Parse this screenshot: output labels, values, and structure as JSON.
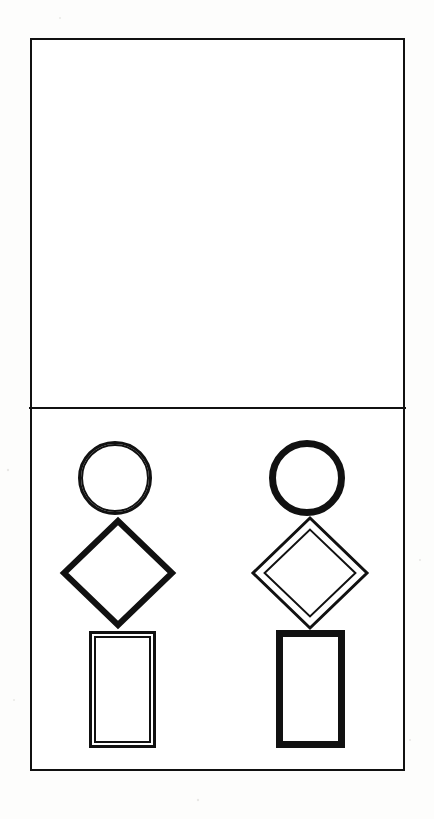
{
  "document": {
    "title": "Two-figure geometric line drawing",
    "background_color": "#fdfdfc",
    "paper_color": "#ffffff",
    "ink_color": "#111111",
    "width": 434,
    "height": 819
  },
  "frame": {
    "name": "outer-rectangle-border",
    "x": 30,
    "y": 38,
    "width": 375,
    "height": 733,
    "stroke_width": 2,
    "stroke_color": "#111111"
  },
  "divider": {
    "name": "horizontal-divider",
    "x1": 30,
    "x2": 405,
    "y": 408,
    "stroke_width": 2,
    "stroke_color": "#111111"
  },
  "panels": [
    {
      "id": "upper-panel",
      "label": "Upper panel",
      "content": "empty",
      "x": 30,
      "y": 38,
      "width": 375,
      "height": 370
    },
    {
      "id": "lower-panel",
      "label": "Lower panel",
      "content": "two figures",
      "x": 30,
      "y": 408,
      "width": 375,
      "height": 363
    }
  ],
  "figures": [
    {
      "id": "left-figure",
      "label": "Left figure",
      "position": "left",
      "parts": [
        {
          "id": "left-head",
          "name": "circle",
          "shape": "circle",
          "line_style": "double",
          "cx": 115,
          "cy": 478,
          "r": 37,
          "inner_r": 33,
          "stroke_width": 3,
          "inner_stroke_width": 2
        },
        {
          "id": "left-body",
          "name": "diamond",
          "shape": "diamond",
          "line_style": "single",
          "cx": 118,
          "cy": 573,
          "rx": 54,
          "ry": 52,
          "stroke_width": 6
        },
        {
          "id": "left-base",
          "name": "rectangle",
          "shape": "rectangle",
          "line_style": "double",
          "x": 89,
          "y": 631,
          "width": 67,
          "height": 117,
          "stroke_width": 3,
          "inset": 6,
          "inner_stroke_width": 2
        }
      ]
    },
    {
      "id": "right-figure",
      "label": "Right figure",
      "position": "right",
      "parts": [
        {
          "id": "right-head",
          "name": "circle",
          "shape": "circle",
          "line_style": "single",
          "cx": 307,
          "cy": 478,
          "r": 38,
          "stroke_width": 7
        },
        {
          "id": "right-body",
          "name": "diamond",
          "shape": "diamond",
          "line_style": "double",
          "cx": 310,
          "cy": 573,
          "rx": 57,
          "ry": 55,
          "stroke_width": 3,
          "inset": 8,
          "inner_stroke_width": 2
        },
        {
          "id": "right-base",
          "name": "rectangle",
          "shape": "rectangle",
          "line_style": "single",
          "x": 276,
          "y": 630,
          "width": 69,
          "height": 118,
          "stroke_width": 7
        }
      ]
    }
  ],
  "specks": [
    {
      "x": 126,
      "y": 96,
      "r": 1.4
    },
    {
      "x": 355,
      "y": 110,
      "r": 1.2
    },
    {
      "x": 141,
      "y": 144,
      "r": 1.3
    },
    {
      "x": 253,
      "y": 125,
      "r": 1.1
    },
    {
      "x": 356,
      "y": 150,
      "r": 1.2
    },
    {
      "x": 78,
      "y": 192,
      "r": 1.1
    },
    {
      "x": 247,
      "y": 226,
      "r": 1.2
    },
    {
      "x": 341,
      "y": 186,
      "r": 1.0
    },
    {
      "x": 167,
      "y": 218,
      "r": 1.1
    },
    {
      "x": 90,
      "y": 195,
      "r": 1.0
    },
    {
      "x": 335,
      "y": 253,
      "r": 1.2
    },
    {
      "x": 200,
      "y": 290,
      "r": 1.0
    },
    {
      "x": 372,
      "y": 330,
      "r": 1.1
    },
    {
      "x": 60,
      "y": 335,
      "r": 1.0
    },
    {
      "x": 155,
      "y": 372,
      "r": 1.1
    },
    {
      "x": 292,
      "y": 360,
      "r": 1.0
    },
    {
      "x": 8,
      "y": 470,
      "r": 1.2
    },
    {
      "x": 420,
      "y": 560,
      "r": 1.1
    },
    {
      "x": 14,
      "y": 700,
      "r": 1.0
    },
    {
      "x": 410,
      "y": 740,
      "r": 1.1
    },
    {
      "x": 206,
      "y": 690,
      "r": 1.1
    },
    {
      "x": 230,
      "y": 600,
      "r": 1.0
    },
    {
      "x": 198,
      "y": 800,
      "r": 1.2
    },
    {
      "x": 60,
      "y": 18,
      "r": 1.0
    }
  ]
}
